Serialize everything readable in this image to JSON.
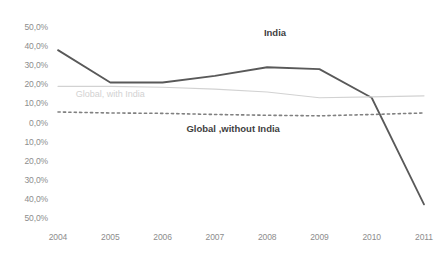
{
  "chart_data": {
    "type": "line",
    "title": "",
    "xlabel": "",
    "ylabel": "",
    "x": [
      2004,
      2005,
      2006,
      2007,
      2008,
      2009,
      2010,
      2011
    ],
    "xtick_labels": [
      "2004",
      "2005",
      "2006",
      "2007",
      "2008",
      "2009",
      "2010",
      "2011"
    ],
    "ytick_labels": [
      "50,0%",
      "40,0%",
      "30,0%",
      "20,0%",
      "10,0%",
      "0,0%",
      "10,0%",
      "20,0%",
      "30,0%",
      "40,0%",
      "50,0%"
    ],
    "ytick_values": [
      50,
      40,
      30,
      20,
      10,
      0,
      -10,
      -20,
      -30,
      -40,
      -50
    ],
    "ylim": [
      -50,
      50
    ],
    "grid": false,
    "legend": "inline-labels",
    "note_axis_labels": "Negative axis values are displayed without a minus sign",
    "series": [
      {
        "name": "India",
        "label": "India",
        "color": "#595959",
        "style": "solid",
        "width": 1.8,
        "label_x": 2008.15,
        "label_y": 47.5,
        "values": [
          38.0,
          21.0,
          21.0,
          24.5,
          29.0,
          28.0,
          13.0,
          -43.0
        ]
      },
      {
        "name": "Global, with India",
        "label": "Global, with India",
        "color": "#d2d2d2",
        "style": "solid",
        "width": 1.2,
        "label_x": 2005.0,
        "label_y": 15.0,
        "values": [
          19.0,
          19.0,
          18.5,
          17.5,
          16.0,
          13.0,
          13.5,
          14.0
        ]
      },
      {
        "name": "Global ,without India",
        "label": "Global ,without India",
        "color": "#808080",
        "style": "dotted",
        "width": 1.6,
        "label_x": 2007.35,
        "label_y": -3.0,
        "values": [
          5.5,
          5.0,
          4.8,
          4.2,
          3.8,
          3.5,
          4.2,
          5.0
        ]
      }
    ]
  }
}
